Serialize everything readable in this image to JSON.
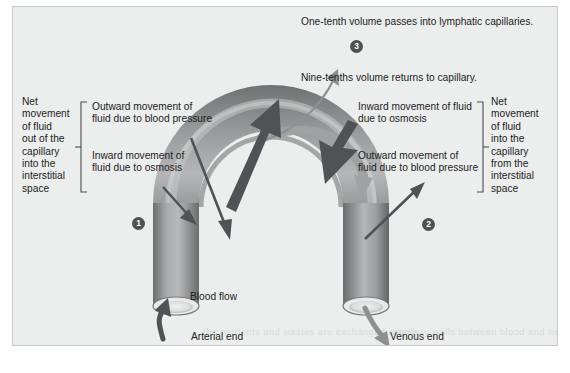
{
  "figure": {
    "background_color": "#eceded",
    "tube_color": "#8a8a8a",
    "arrow_color": "#54585a",
    "return_arrow_color": "#9a9d9e",
    "marker_color": "#4e5152"
  },
  "left_group": {
    "bracket_label": "Net\nmovement\nof fluid\nout of the\ncapillary\ninto the\ninterstitial\nspace",
    "items": [
      "Outward movement of\nfluid due to blood pressure",
      "Inward movement of\nfluid due to osmosis"
    ]
  },
  "right_group": {
    "bracket_label": "Net\nmovement\nof fluid\ninto the\ncapillary\nfrom the\ninterstitial\nspace",
    "items": [
      "Inward movement of fluid\ndue to osmosis",
      "Outward movement of\nfluid due to blood pressure"
    ]
  },
  "top_labels": {
    "lymphatic": "One-tenth volume passes into lymphatic capillaries.",
    "return": "Nine-tenths volume returns to capillary."
  },
  "bottom_labels": {
    "blood_flow": "Blood flow",
    "arterial_end": "Arterial end",
    "venous_end": "Venous end"
  },
  "markers": [
    {
      "id": "1",
      "label": "1"
    },
    {
      "id": "2",
      "label": "2"
    },
    {
      "id": "3",
      "label": "3"
    }
  ],
  "bleed_through": [
    "the nutrients and wastes are exchanged across",
    "capillary walls between blood and tissue"
  ]
}
